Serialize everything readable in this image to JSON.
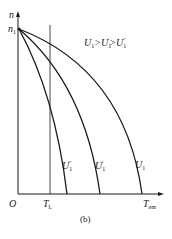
{
  "diagram": {
    "caption": "(b)",
    "y_axis": {
      "label": "n",
      "start_label": "n",
      "start_sub": "1"
    },
    "x_axis": {
      "origin": "O",
      "tl_label": "T",
      "tl_sub": "L",
      "tem_label": "T",
      "tem_sub": "em"
    },
    "legend": {
      "text_parts": [
        "U",
        "1",
        ">U",
        "1",
        "'",
        ">U",
        "1",
        "''"
      ]
    },
    "curves": [
      {
        "name": "U1''",
        "label": "U",
        "sub": "1",
        "prime": "''",
        "end_x": 67
      },
      {
        "name": "U1'",
        "label": "U",
        "sub": "1",
        "prime": "'",
        "end_x": 100
      },
      {
        "name": "U1",
        "label": "U",
        "sub": "1",
        "prime": "",
        "end_x": 142
      }
    ],
    "colors": {
      "line": "#1a1a1a",
      "background": "#ffffff"
    }
  }
}
